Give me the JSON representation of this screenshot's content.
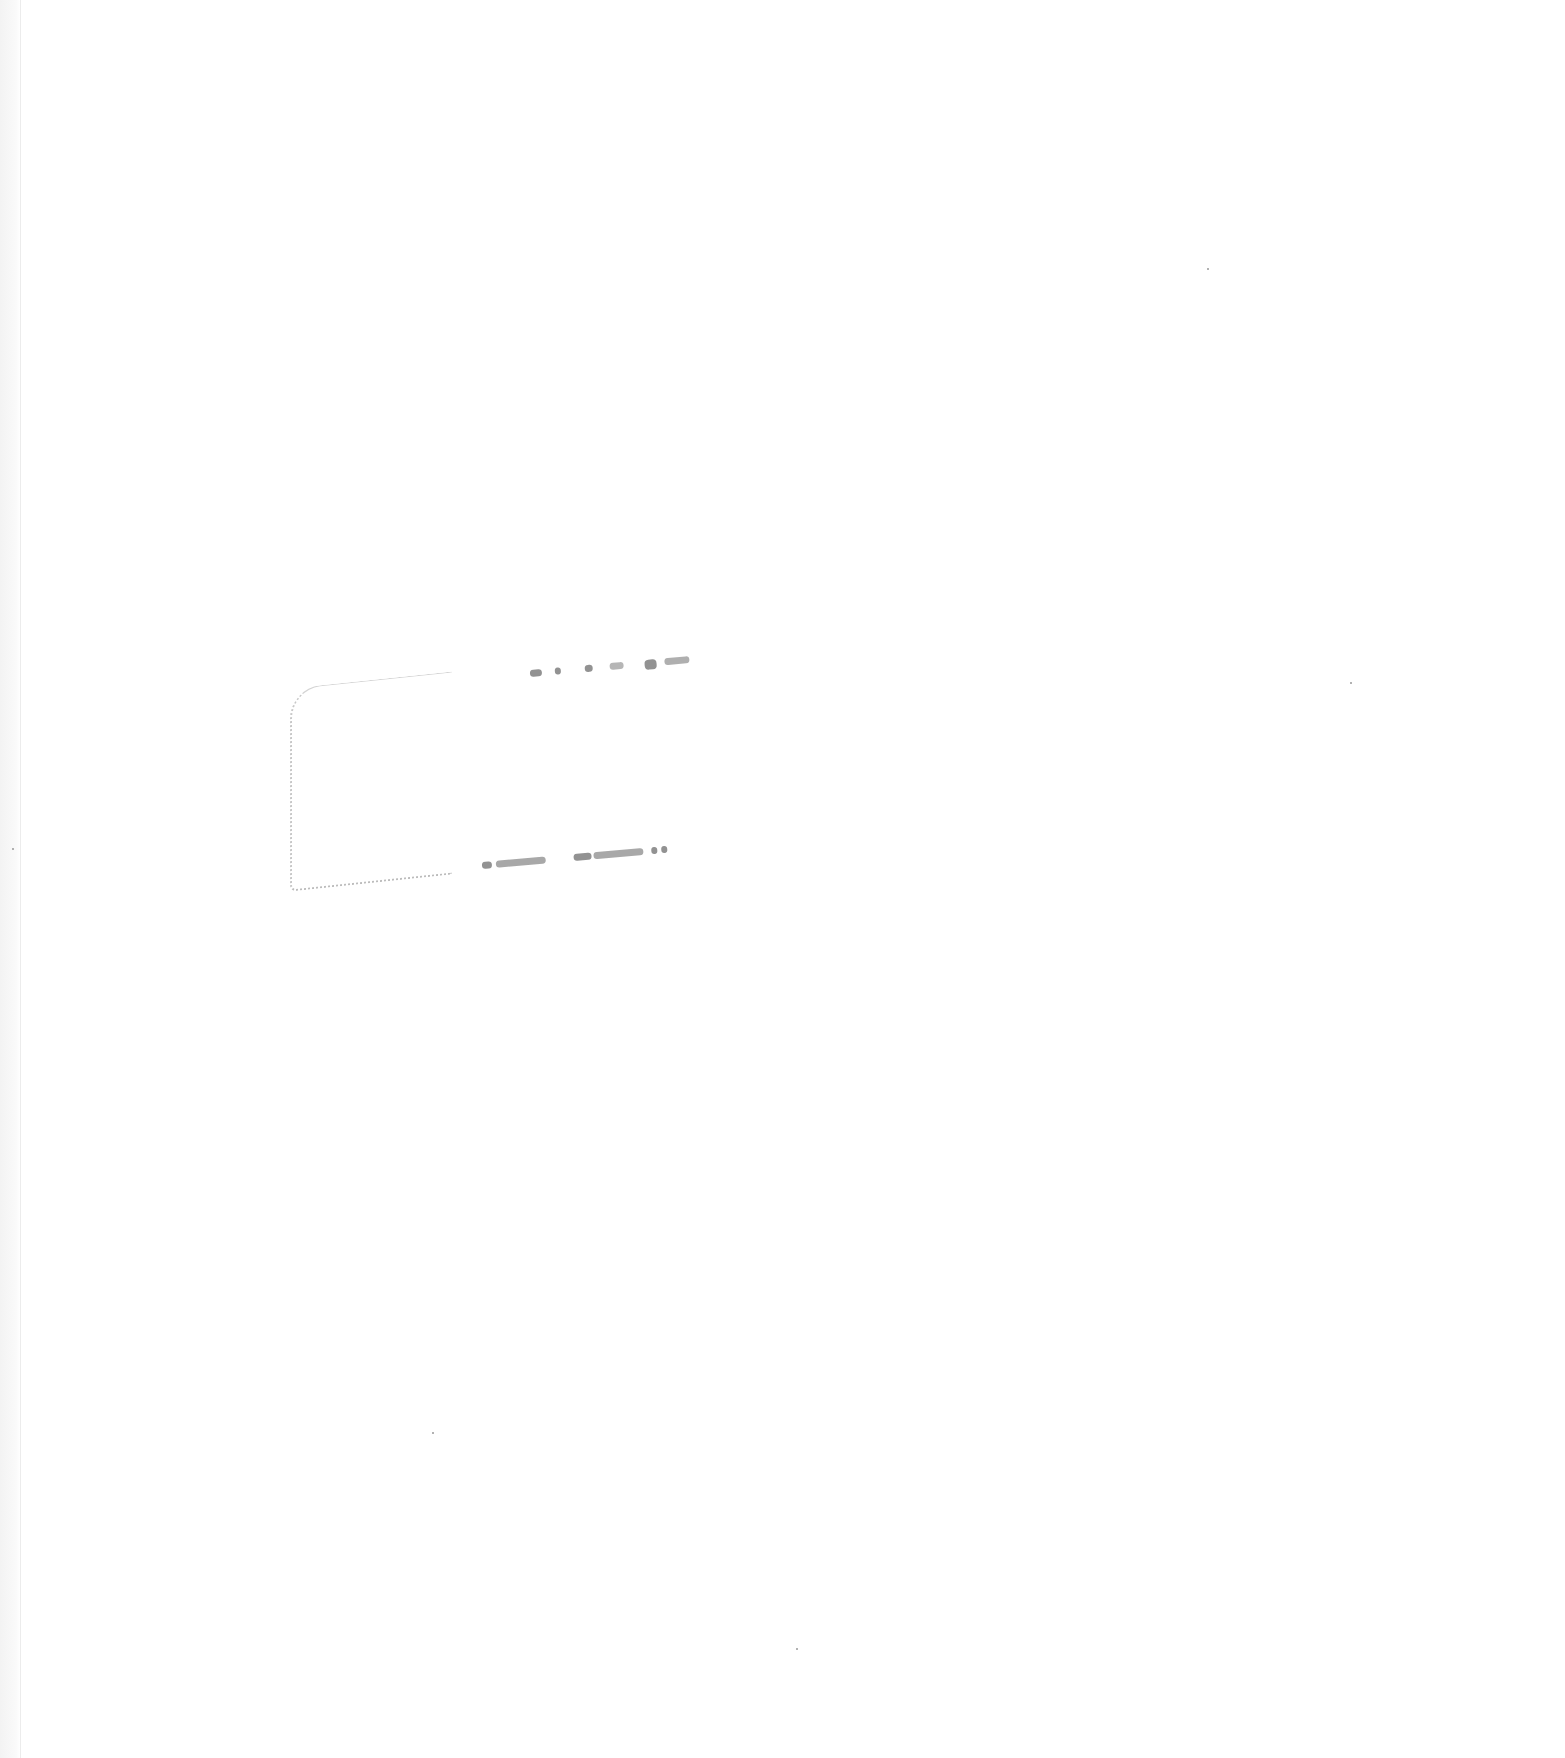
{
  "document": {
    "type": "scanned-blank-page",
    "text_content": "",
    "background_color": "#ffffff",
    "mark_color": "#6e6e6e"
  }
}
